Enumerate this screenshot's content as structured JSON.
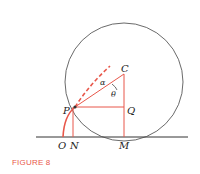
{
  "caption": "FIGURE 8",
  "colors": {
    "accent": "#e8574a",
    "line": "#333333"
  },
  "labels": {
    "C": "C",
    "P": "P",
    "Q": "Q",
    "O": "O",
    "N": "N",
    "M": "M",
    "alpha": "α",
    "theta": "θ"
  }
}
